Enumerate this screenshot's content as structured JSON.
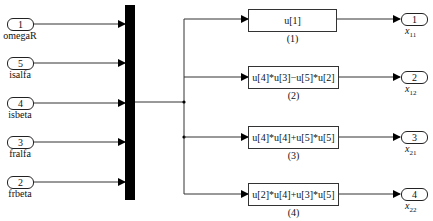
{
  "inports": [
    {
      "number": "1",
      "name": "omegaR",
      "y": 24
    },
    {
      "number": "5",
      "name": "isalfa",
      "y": 63
    },
    {
      "number": "4",
      "name": "isbeta",
      "y": 103
    },
    {
      "number": "3",
      "name": "fralfa",
      "y": 142
    },
    {
      "number": "2",
      "name": "frbeta",
      "y": 182
    }
  ],
  "fcn_blocks": [
    {
      "expr": "u[1]",
      "label": "(1)"
    },
    {
      "expr": "u[4]*u[3]−u[5]*u[2]",
      "label": "(2)"
    },
    {
      "expr": "u[4]*u[4]+u[5]*u[5]",
      "label": "(3)"
    },
    {
      "expr": "u[2]*u[4]+u[3]*u[5]",
      "label": "(4)"
    }
  ],
  "outports": [
    {
      "number": "1",
      "var": "x",
      "sub": "11"
    },
    {
      "number": "2",
      "var": "x",
      "sub": "12"
    },
    {
      "number": "3",
      "var": "x",
      "sub": "21"
    },
    {
      "number": "4",
      "var": "x",
      "sub": "22"
    }
  ]
}
